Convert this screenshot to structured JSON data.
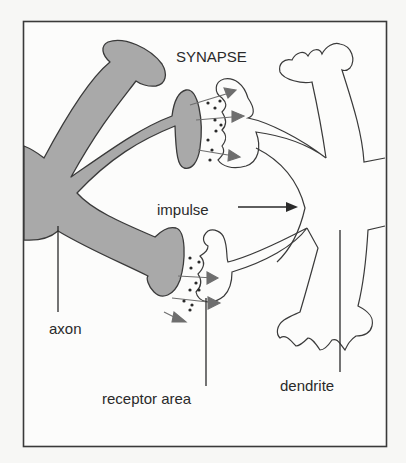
{
  "diagram": {
    "title": "SYNAPSE",
    "labels": {
      "impulse": "impulse",
      "axon": "axon",
      "receptor_area": "receptor area",
      "dendrite": "dendrite"
    },
    "colors": {
      "background": "#f7f7f5",
      "axon_fill": "#a9a9a9",
      "outline": "#3a3a3a",
      "arrow": "#6e6e6e",
      "text": "#2a2a2a"
    },
    "icons": {
      "impulse_arrow": "arrow-right-icon",
      "neurotransmitter": "dot-icon",
      "transmission_arrow": "arrow-right-icon"
    }
  }
}
